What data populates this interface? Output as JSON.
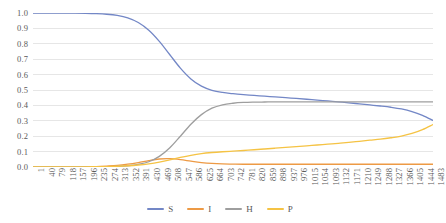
{
  "chart_data": {
    "type": "line",
    "title": "",
    "xlabel": "",
    "ylabel": "",
    "ylim": [
      0.0,
      1.0
    ],
    "grid": true,
    "legend_position": "bottom",
    "y_ticks": [
      "0.0",
      "0.1",
      "0.2",
      "0.3",
      "0.4",
      "0.5",
      "0.6",
      "0.7",
      "0.8",
      "0.9",
      "1.0"
    ],
    "x_ticks": [
      "1",
      "40",
      "79",
      "118",
      "157",
      "196",
      "235",
      "274",
      "313",
      "352",
      "391",
      "430",
      "469",
      "508",
      "547",
      "586",
      "625",
      "664",
      "703",
      "742",
      "781",
      "820",
      "859",
      "898",
      "937",
      "976",
      "1015",
      "1054",
      "1093",
      "1132",
      "1171",
      "1210",
      "1249",
      "1288",
      "1327",
      "1366",
      "1405",
      "1444",
      "1483"
    ],
    "x": [
      1,
      40,
      79,
      118,
      157,
      196,
      235,
      274,
      313,
      352,
      391,
      430,
      469,
      508,
      547,
      586,
      625,
      664,
      703,
      742,
      781,
      820,
      859,
      898,
      937,
      976,
      1015,
      1054,
      1093,
      1132,
      1171,
      1210,
      1249,
      1288,
      1327,
      1366,
      1405,
      1444,
      1483
    ],
    "series": [
      {
        "name": "S",
        "color": "#7387c6",
        "values": [
          1.0,
          1.0,
          1.0,
          0.999,
          0.999,
          0.998,
          0.996,
          0.992,
          0.984,
          0.968,
          0.938,
          0.888,
          0.816,
          0.729,
          0.642,
          0.572,
          0.525,
          0.498,
          0.484,
          0.476,
          0.47,
          0.465,
          0.46,
          0.455,
          0.45,
          0.445,
          0.44,
          0.434,
          0.429,
          0.423,
          0.417,
          0.41,
          0.403,
          0.396,
          0.388,
          0.377,
          0.36,
          0.335,
          0.302
        ]
      },
      {
        "name": "I",
        "color": "#ed9a45",
        "values": [
          0.0,
          0.0,
          0.0,
          0.001,
          0.001,
          0.002,
          0.003,
          0.006,
          0.01,
          0.018,
          0.029,
          0.042,
          0.052,
          0.054,
          0.048,
          0.038,
          0.029,
          0.023,
          0.02,
          0.019,
          0.018,
          0.018,
          0.018,
          0.018,
          0.018,
          0.018,
          0.018,
          0.018,
          0.018,
          0.018,
          0.018,
          0.018,
          0.018,
          0.018,
          0.018,
          0.018,
          0.018,
          0.018,
          0.018
        ]
      },
      {
        "name": "H",
        "color": "#9e9e9e",
        "values": [
          0.0,
          0.0,
          0.0,
          0.0,
          0.0,
          0.0,
          0.001,
          0.002,
          0.004,
          0.008,
          0.017,
          0.034,
          0.069,
          0.125,
          0.2,
          0.278,
          0.34,
          0.382,
          0.404,
          0.414,
          0.419,
          0.421,
          0.422,
          0.423,
          0.423,
          0.423,
          0.423,
          0.423,
          0.423,
          0.423,
          0.423,
          0.423,
          0.423,
          0.423,
          0.423,
          0.423,
          0.423,
          0.423,
          0.423
        ]
      },
      {
        "name": "P",
        "color": "#f5c344",
        "values": [
          0.0,
          0.0,
          0.0,
          0.0,
          0.001,
          0.001,
          0.002,
          0.003,
          0.005,
          0.008,
          0.013,
          0.021,
          0.032,
          0.046,
          0.062,
          0.076,
          0.087,
          0.094,
          0.099,
          0.103,
          0.107,
          0.112,
          0.117,
          0.122,
          0.127,
          0.132,
          0.137,
          0.143,
          0.148,
          0.154,
          0.16,
          0.167,
          0.174,
          0.181,
          0.19,
          0.201,
          0.218,
          0.243,
          0.276
        ]
      }
    ]
  },
  "legend": {
    "items": [
      {
        "label": "S",
        "color": "#7387c6"
      },
      {
        "label": "I",
        "color": "#ed9a45"
      },
      {
        "label": "H",
        "color": "#9e9e9e"
      },
      {
        "label": "P",
        "color": "#f5c344"
      }
    ]
  },
  "style": {
    "gridline_color": "#e6e6e6",
    "tick_label_color": "#595959",
    "plot_background": "#ffffff"
  }
}
